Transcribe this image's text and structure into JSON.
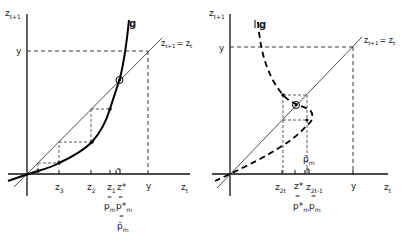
{
  "left_panel": {
    "y_axis_label": "z",
    "y_axis_sub": "t+1",
    "x_axis_label": "z",
    "x_axis_sub": "t",
    "y_level_label": "y",
    "diagonal_label": "z",
    "diagonal_sub1": "t+1",
    "diagonal_eq": "= z",
    "diagonal_sub2": "t",
    "curve_label": "g",
    "ticks": [
      {
        "label": "z",
        "sub": "3"
      },
      {
        "label": "z",
        "sub": "2"
      },
      {
        "label": "z",
        "sub": "1"
      },
      {
        "label": "z*",
        "sub": ""
      },
      {
        "label": "y",
        "sub": ""
      }
    ],
    "annot_pm": "p",
    "annot_pm_sub": "m",
    "annot_pm_star": "p*",
    "annot_pm_star_sub": "m",
    "annot_pbar": "p̄",
    "annot_pbar_sub": "m",
    "eq_sign": "="
  },
  "right_panel": {
    "y_axis_label": "z",
    "y_axis_sub": "t+1",
    "x_axis_label": "z",
    "x_axis_sub": "t",
    "y_level_label": "y",
    "diagonal_label": "z",
    "diagonal_sub1": "t+1",
    "diagonal_eq": "= z",
    "diagonal_sub2": "t",
    "curve_label": "g",
    "pbar_label": "p̄",
    "pbar_sub": "m",
    "ticks": [
      {
        "label": "z",
        "sub": "2t"
      },
      {
        "label": "z*",
        "sub": ""
      },
      {
        "label": "z",
        "sub": "2t-1"
      },
      {
        "label": "y",
        "sub": ""
      }
    ],
    "annot_pm_star": "p*",
    "annot_pm_star_sub": "m",
    "annot_pm": "p",
    "annot_pm_sub": "m",
    "eq_sign": "="
  }
}
